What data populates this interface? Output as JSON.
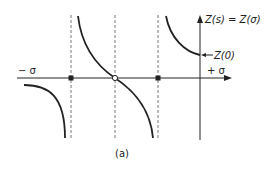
{
  "figure": {
    "caption": "(a)",
    "axes": {
      "neg_sigma_label": "− σ",
      "pos_sigma_label": "+ σ",
      "vertical_label": "Z(s) = Z(σ)",
      "z0_label": "Z(0)"
    },
    "markers": {
      "poles": "filled squares on σ-axis at dashed asymptotes",
      "zero": "open circle at center crossing"
    },
    "colors": {
      "line": "#222222",
      "dashed": "#555555",
      "background": "#ffffff"
    }
  }
}
